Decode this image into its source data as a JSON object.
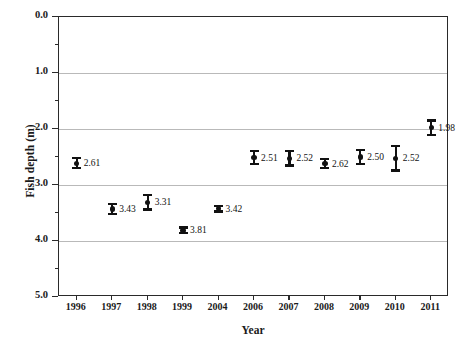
{
  "chart_data": {
    "type": "scatter",
    "title": "",
    "xlabel": "Year",
    "ylabel": "Fish depth (m)",
    "categories": [
      "1996",
      "1997",
      "1998",
      "1999",
      "2004",
      "2006",
      "2007",
      "2008",
      "2009",
      "2010",
      "2011"
    ],
    "values": [
      2.61,
      3.43,
      3.31,
      3.81,
      3.42,
      2.51,
      2.52,
      2.62,
      2.5,
      2.52,
      1.98
    ],
    "errors": [
      0.09,
      0.09,
      0.13,
      0.05,
      0.05,
      0.12,
      0.13,
      0.08,
      0.12,
      0.22,
      0.13
    ],
    "point_labels": [
      "2.61",
      "3.43",
      "3.31",
      "3.81",
      "3.42",
      "2.51",
      "2.52",
      "2.62",
      "2.50",
      "2.52",
      "1.98"
    ],
    "ylim": [
      0.0,
      5.0
    ],
    "y_inverted": true,
    "y_major_ticks": [
      0.0,
      1.0,
      2.0,
      3.0,
      4.0,
      5.0
    ],
    "y_major_tick_labels": [
      "0.0",
      "1.0",
      "2.0",
      "3.0",
      "4.0",
      "5.0"
    ],
    "y_minor_ticks": [
      0.5,
      1.5,
      2.5,
      3.5,
      4.5
    ],
    "grid": "horizontal-major",
    "legend": "none",
    "marker_color": "#111111",
    "grid_color": "#b9b9b9",
    "axis_color": "#2a2a2a"
  }
}
